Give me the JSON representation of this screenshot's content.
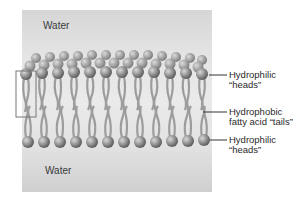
{
  "diagram": {
    "regions": {
      "top_water": "Water",
      "bottom_water": "Water"
    },
    "labels": [
      {
        "line1": "Hydrophilic",
        "line2": "“heads”"
      },
      {
        "line1": "Hydrophobic",
        "line2": "fatty acid “tails”"
      },
      {
        "line1": "Hydrophilic",
        "line2": "“heads”"
      }
    ],
    "colors": {
      "head": "#8a8a8a",
      "tail": "#a9a9a9",
      "water_panel": "#e2e2e2",
      "highlight_box": "#7a7a7a"
    }
  }
}
